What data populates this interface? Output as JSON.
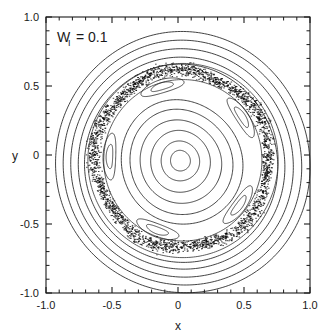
{
  "chart_data": {
    "type": "scatter",
    "title": "",
    "subtitle": "",
    "xlabel": "x",
    "ylabel": "y",
    "xlim": [
      -1.0,
      1.0
    ],
    "ylim": [
      -1.0,
      1.0
    ],
    "grid": false,
    "legend": null,
    "legend_position": "none",
    "annotations": [
      {
        "id": "parameter-label",
        "text": "W_I = 0.1",
        "text_main": "W",
        "text_sub": "I",
        "text_value": "= 0.1",
        "x": -0.78,
        "y": 0.86
      }
    ],
    "xticks": [
      -1.0,
      -0.5,
      0.0,
      0.5,
      1.0
    ],
    "xtick_labels": [
      "-1.0",
      "-0.5",
      "0",
      "0.5",
      "1.0"
    ],
    "yticks": [
      -1.0,
      -0.5,
      0.0,
      0.5,
      1.0
    ],
    "ytick_labels": [
      "-1.0",
      "-0.5",
      "0",
      "0.5",
      "1.0"
    ],
    "minor_ticks_between": 4,
    "series": [
      {
        "name": "outer-invariant-tori",
        "kind": "closed-curve-family",
        "description": "Outer nested near-circular invariant curves (regular orbits)",
        "center": [
          0.02,
          -0.05
        ],
        "radii": [
          0.955,
          0.895,
          0.835,
          0.775,
          0.725
        ],
        "eccentricity": 0.02,
        "color": "#222222"
      },
      {
        "name": "chaotic-band",
        "kind": "scatter-band",
        "description": "Stochastic layer of scattered points surrounding the island chain",
        "center": [
          0.03,
          -0.03
        ],
        "inner_radius": 0.6,
        "outer_radius": 0.7,
        "point_count": 2600,
        "color": "#000000"
      },
      {
        "name": "island-chain-period-5",
        "kind": "island-chain",
        "description": "Chain of five elongated islands embedded in the stochastic layer",
        "count": 5,
        "center": [
          0.03,
          -0.03
        ],
        "island_radius": 0.55,
        "island_semi_major": 0.17,
        "island_semi_minor": 0.048,
        "phase_deg": 106,
        "color": "#222222"
      },
      {
        "name": "inner-invariant-tori",
        "kind": "closed-curve-family",
        "description": "Inner nested invariant curves around the central fixed point",
        "center": [
          0.02,
          -0.04
        ],
        "radii": [
          0.455,
          0.385,
          0.305,
          0.225,
          0.145,
          0.075
        ],
        "eccentricity": 0.03,
        "color": "#222222"
      }
    ]
  },
  "axes": {
    "frame_color": "#1a1a1a",
    "background": "#ffffff"
  }
}
